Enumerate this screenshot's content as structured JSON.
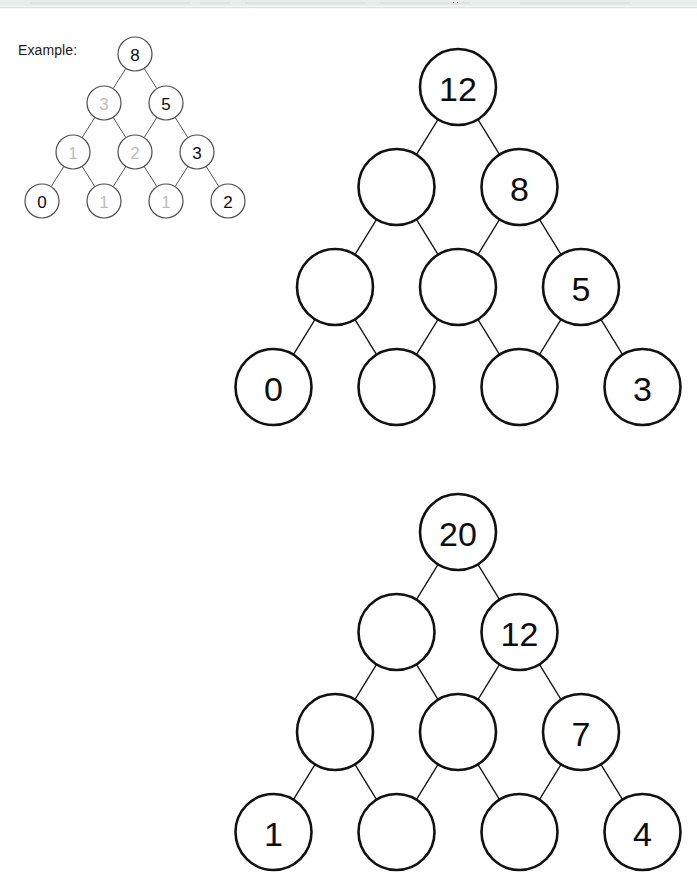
{
  "chrome": {
    "glyph": "··"
  },
  "worksheet": {
    "example_label": "Example:"
  },
  "example_tree": {
    "name": "example-tree",
    "rows": [
      [
        {
          "value": "8",
          "style": "given"
        }
      ],
      [
        {
          "value": "3",
          "style": "blank-filled"
        },
        {
          "value": "5",
          "style": "given"
        }
      ],
      [
        {
          "value": "1",
          "style": "blank-filled"
        },
        {
          "value": "2",
          "style": "blank-filled"
        },
        {
          "value": "3",
          "style": "given"
        }
      ],
      [
        {
          "value": "0",
          "style": "given"
        },
        {
          "value": "1",
          "style": "blank-filled"
        },
        {
          "value": "1",
          "style": "blank-filled"
        },
        {
          "value": "2",
          "style": "given"
        }
      ]
    ]
  },
  "puzzle_trees": [
    {
      "name": "puzzle-tree-1",
      "rows": [
        [
          {
            "value": "12",
            "style": "given"
          }
        ],
        [
          {
            "value": "",
            "style": "empty"
          },
          {
            "value": "8",
            "style": "given"
          }
        ],
        [
          {
            "value": "",
            "style": "empty"
          },
          {
            "value": "",
            "style": "empty"
          },
          {
            "value": "5",
            "style": "given"
          }
        ],
        [
          {
            "value": "0",
            "style": "given"
          },
          {
            "value": "",
            "style": "empty"
          },
          {
            "value": "",
            "style": "empty"
          },
          {
            "value": "3",
            "style": "given"
          }
        ]
      ]
    },
    {
      "name": "puzzle-tree-2",
      "rows": [
        [
          {
            "value": "20",
            "style": "given"
          }
        ],
        [
          {
            "value": "",
            "style": "empty"
          },
          {
            "value": "12",
            "style": "given"
          }
        ],
        [
          {
            "value": "",
            "style": "empty"
          },
          {
            "value": "",
            "style": "empty"
          },
          {
            "value": "7",
            "style": "given"
          }
        ],
        [
          {
            "value": "1",
            "style": "given"
          },
          {
            "value": "",
            "style": "empty"
          },
          {
            "value": "",
            "style": "empty"
          },
          {
            "value": "4",
            "style": "given"
          }
        ]
      ]
    }
  ],
  "colors": {
    "ink": "#111111",
    "filled_answer": "#bdbdbd",
    "paper": "#ffffff"
  }
}
